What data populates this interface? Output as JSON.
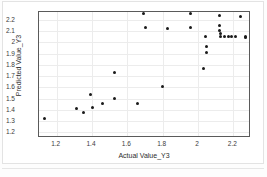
{
  "chart_data": {
    "type": "scatter",
    "title": "",
    "xlabel": "Actual Value_Y3",
    "ylabel": "Predicted Value_Y3",
    "xlim": [
      1.1,
      2.3
    ],
    "ylim": [
      1.15,
      2.27
    ],
    "xticks": [
      "1.2",
      "1.4",
      "1.6",
      "1.8",
      "2",
      "2.2"
    ],
    "xtick_values": [
      1.2,
      1.4,
      1.6,
      1.8,
      2.0,
      2.2
    ],
    "yticks": [
      "1.2",
      "1.3",
      "1.4",
      "1.5",
      "1.6",
      "1.7",
      "1.8",
      "1.9",
      "2",
      "2.1",
      "2.2"
    ],
    "ytick_values": [
      1.2,
      1.3,
      1.4,
      1.5,
      1.6,
      1.7,
      1.8,
      1.9,
      2.0,
      2.1,
      2.2
    ],
    "grid": true,
    "legend": "none",
    "marker_color": "#1a1a1a",
    "marker_shape": "circle",
    "points": [
      {
        "x": 1.13,
        "y": 1.32
      },
      {
        "x": 1.31,
        "y": 1.41
      },
      {
        "x": 1.35,
        "y": 1.38
      },
      {
        "x": 1.39,
        "y": 1.54
      },
      {
        "x": 1.4,
        "y": 1.42
      },
      {
        "x": 1.46,
        "y": 1.46
      },
      {
        "x": 1.53,
        "y": 1.73
      },
      {
        "x": 1.53,
        "y": 1.5
      },
      {
        "x": 1.66,
        "y": 1.46
      },
      {
        "x": 1.69,
        "y": 2.26
      },
      {
        "x": 1.7,
        "y": 2.13
      },
      {
        "x": 1.8,
        "y": 1.61
      },
      {
        "x": 1.83,
        "y": 2.12
      },
      {
        "x": 1.96,
        "y": 2.26
      },
      {
        "x": 1.96,
        "y": 2.13
      },
      {
        "x": 2.03,
        "y": 1.77
      },
      {
        "x": 2.04,
        "y": 2.05
      },
      {
        "x": 2.05,
        "y": 1.96
      },
      {
        "x": 2.05,
        "y": 1.91
      },
      {
        "x": 2.12,
        "y": 2.24
      },
      {
        "x": 2.12,
        "y": 2.15
      },
      {
        "x": 2.12,
        "y": 2.11
      },
      {
        "x": 2.13,
        "y": 2.08
      },
      {
        "x": 2.13,
        "y": 2.05
      },
      {
        "x": 2.15,
        "y": 2.05
      },
      {
        "x": 2.17,
        "y": 2.05
      },
      {
        "x": 2.19,
        "y": 2.05
      },
      {
        "x": 2.21,
        "y": 2.05
      },
      {
        "x": 2.24,
        "y": 2.23
      },
      {
        "x": 2.27,
        "y": 2.05
      },
      {
        "x": 2.27,
        "y": 2.04
      }
    ]
  }
}
